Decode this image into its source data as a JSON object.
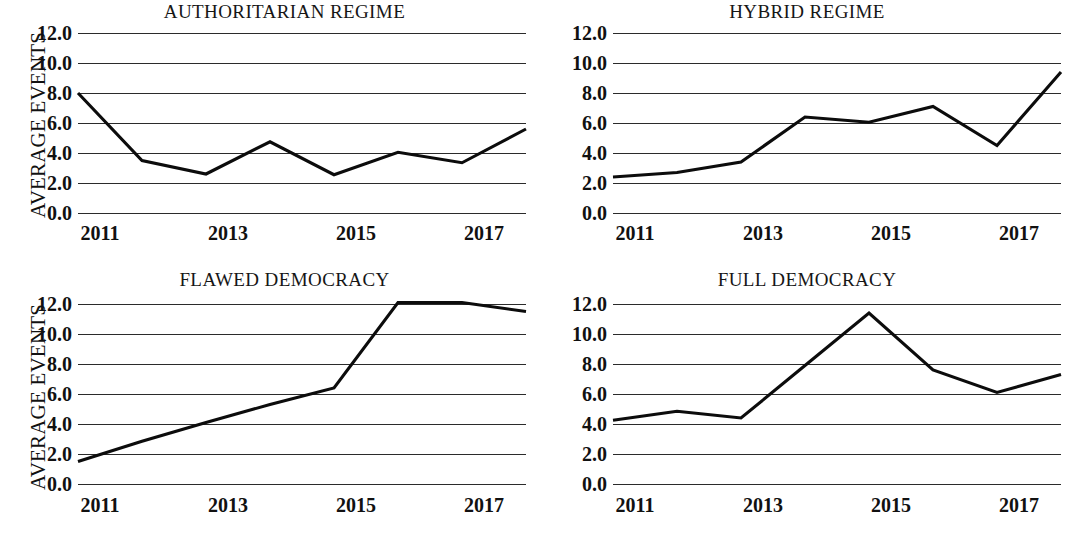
{
  "figure": {
    "y_axis_title": "AVERAGE EVENTS",
    "y_ticks": [
      "0.0",
      "2.0",
      "4.0",
      "6.0",
      "8.0",
      "10.0",
      "12.0"
    ],
    "x_ticks": [
      "2011",
      "2013",
      "2015",
      "2017"
    ],
    "line_color": "#0c0c0c",
    "grid_color": "#2b2b2b",
    "background_color": "#ffffff"
  },
  "panels": [
    {
      "id": "authoritarian-regime",
      "title": "AUTHORITARIAN REGIME",
      "position": "top-left",
      "has_y_axis_title": true
    },
    {
      "id": "hybrid-regime",
      "title": "HYBRID REGIME",
      "position": "top-right",
      "has_y_axis_title": false
    },
    {
      "id": "flawed-democracy",
      "title": "FLAWED DEMOCRACY",
      "position": "bottom-left",
      "has_y_axis_title": true
    },
    {
      "id": "full-democracy",
      "title": "FULL DEMOCRACY",
      "position": "bottom-right",
      "has_y_axis_title": false
    }
  ],
  "chart_data": [
    {
      "type": "line",
      "title": "AUTHORITARIAN REGIME",
      "xlabel": "",
      "ylabel": "AVERAGE EVENTS",
      "x": [
        2011,
        2012,
        2013,
        2014,
        2015,
        2016,
        2017,
        2018
      ],
      "values": [
        8.0,
        3.5,
        2.6,
        4.75,
        2.55,
        4.05,
        3.35,
        5.6
      ],
      "xticklabels": [
        "2011",
        "2013",
        "2015",
        "2017"
      ],
      "xtickvalues": [
        2011,
        2013,
        2015,
        2017
      ],
      "yticklabels": [
        "0.0",
        "2.0",
        "4.0",
        "6.0",
        "8.0",
        "10.0",
        "12.0"
      ],
      "ylim": [
        0,
        12
      ],
      "xlim": [
        2011,
        2018
      ],
      "grid": "horizontal",
      "legend": "none"
    },
    {
      "type": "line",
      "title": "HYBRID REGIME",
      "xlabel": "",
      "ylabel": "",
      "x": [
        2011,
        2012,
        2013,
        2014,
        2015,
        2016,
        2017,
        2018
      ],
      "values": [
        2.4,
        2.7,
        3.4,
        6.4,
        6.05,
        7.1,
        4.5,
        9.4
      ],
      "xticklabels": [
        "2011",
        "2013",
        "2015",
        "2017"
      ],
      "xtickvalues": [
        2011,
        2013,
        2015,
        2017
      ],
      "yticklabels": [
        "0.0",
        "2.0",
        "4.0",
        "6.0",
        "8.0",
        "10.0",
        "12.0"
      ],
      "ylim": [
        0,
        12
      ],
      "xlim": [
        2011,
        2018
      ],
      "grid": "horizontal",
      "legend": "none"
    },
    {
      "type": "line",
      "title": "FLAWED DEMOCRACY",
      "xlabel": "",
      "ylabel": "AVERAGE EVENTS",
      "x": [
        2011,
        2012,
        2013,
        2014,
        2015,
        2016,
        2017,
        2018
      ],
      "values": [
        1.5,
        2.85,
        4.1,
        5.3,
        6.4,
        12.1,
        12.1,
        11.5
      ],
      "xticklabels": [
        "2011",
        "2013",
        "2015",
        "2017"
      ],
      "xtickvalues": [
        2011,
        2013,
        2015,
        2017
      ],
      "yticklabels": [
        "0.0",
        "2.0",
        "4.0",
        "6.0",
        "8.0",
        "10.0",
        "12.0"
      ],
      "ylim": [
        0,
        12
      ],
      "xlim": [
        2011,
        2018
      ],
      "grid": "horizontal",
      "legend": "none"
    },
    {
      "type": "line",
      "title": "FULL DEMOCRACY",
      "xlabel": "",
      "ylabel": "",
      "x": [
        2011,
        2012,
        2013,
        2014,
        2015,
        2016,
        2017,
        2018
      ],
      "values": [
        4.25,
        4.85,
        4.4,
        7.9,
        11.4,
        7.6,
        6.1,
        7.3
      ],
      "xticklabels": [
        "2011",
        "2013",
        "2015",
        "2017"
      ],
      "xtickvalues": [
        2011,
        2013,
        2015,
        2017
      ],
      "yticklabels": [
        "0.0",
        "2.0",
        "4.0",
        "6.0",
        "8.0",
        "10.0",
        "12.0"
      ],
      "ylim": [
        0,
        12
      ],
      "xlim": [
        2011,
        2018
      ],
      "grid": "horizontal",
      "legend": "none"
    }
  ]
}
